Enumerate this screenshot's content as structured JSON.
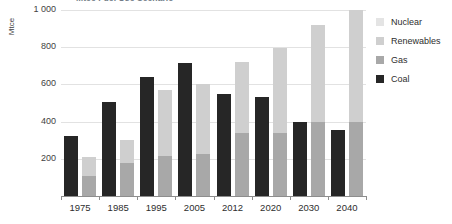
{
  "chart_data": {
    "type": "bar",
    "title": "Mtce Fuel Use Scenario",
    "xlabel": "",
    "ylabel": "Mtce",
    "ylim": [
      0,
      1000
    ],
    "yticks": [
      200,
      400,
      600,
      800,
      1000
    ],
    "ytick_labels": [
      "200",
      "400",
      "600",
      "800",
      "1 000"
    ],
    "grid": true,
    "legend_position": "right",
    "stacked": true,
    "categories": [
      "1975",
      "1985",
      "1995",
      "2005",
      "2012",
      "2020",
      "2030",
      "2040"
    ],
    "series": [
      {
        "name": "Coal",
        "color": "#262626",
        "values": [
          320,
          505,
          640,
          715,
          550,
          530,
          400,
          355
        ]
      },
      {
        "name": "Gas",
        "color": "#a8a8a8",
        "values": [
          105,
          175,
          215,
          225,
          340,
          340,
          400,
          400
        ]
      },
      {
        "name": "Renewables",
        "color": "#cfcfcf",
        "values": [
          105,
          125,
          355,
          375,
          380,
          455,
          520,
          600
        ]
      },
      {
        "name": "Nuclear",
        "color": "#e4e4e4",
        "values": [
          0,
          0,
          0,
          0,
          0,
          0,
          0,
          0
        ]
      }
    ],
    "stack_totals": [
      210,
      300,
      570,
      600,
      720,
      795,
      920,
      1000
    ],
    "annotations": []
  },
  "legend": {
    "items": [
      {
        "label": "Nuclear",
        "color": "#e4e4e4"
      },
      {
        "label": "Renewables",
        "color": "#cfcfcf"
      },
      {
        "label": "Gas",
        "color": "#a8a8a8"
      },
      {
        "label": "Coal",
        "color": "#262626"
      }
    ]
  }
}
